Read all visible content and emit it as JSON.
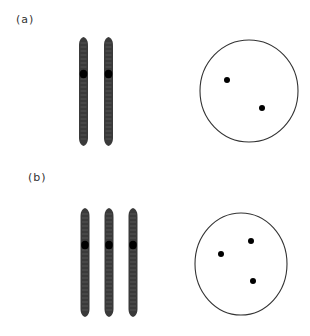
{
  "panels": [
    {
      "label": "(a)",
      "label_pos": {
        "x": 16,
        "y": 14
      },
      "chromosomes": [
        {
          "cx": 83.5,
          "top": 37,
          "bottom": 146,
          "centromere_y": 74
        },
        {
          "cx": 108.5,
          "top": 37,
          "bottom": 146,
          "centromere_y": 74
        }
      ],
      "cell": {
        "cx": 249,
        "cy": 91,
        "rx": 49,
        "ry": 51
      },
      "dots": [
        {
          "x": 227,
          "y": 80
        },
        {
          "x": 262,
          "y": 108
        }
      ]
    },
    {
      "label": "(b)",
      "label_pos": {
        "x": 28,
        "y": 172
      },
      "chromosomes": [
        {
          "cx": 85,
          "top": 208,
          "bottom": 317,
          "centromere_y": 245
        },
        {
          "cx": 109,
          "top": 208,
          "bottom": 317,
          "centromere_y": 245
        },
        {
          "cx": 133,
          "top": 208,
          "bottom": 317,
          "centromere_y": 245
        }
      ],
      "cell": {
        "cx": 241,
        "cy": 264,
        "rx": 46,
        "ry": 51
      },
      "dots": [
        {
          "x": 221,
          "y": 254
        },
        {
          "x": 251,
          "y": 241
        },
        {
          "x": 253,
          "y": 281
        }
      ]
    }
  ],
  "colors": {
    "chromosome": "#3a3a3a",
    "chromosome_band": "#6a6a6a",
    "centromere": "#000000",
    "cell_outline": "#333333",
    "dot": "#000000",
    "label": "#333333"
  }
}
